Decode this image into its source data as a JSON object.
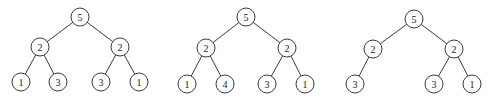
{
  "diagram": {
    "type": "binary-trees",
    "node_radius": 9,
    "colors": {
      "stroke": "#3a3a3a",
      "text": "#222222",
      "fill": "#ffffff"
    },
    "trees": [
      {
        "name": "tree-1",
        "nodes": [
          {
            "id": "r",
            "label": "5",
            "x": 80,
            "y": 17
          },
          {
            "id": "l",
            "label": "2",
            "x": 40,
            "y": 47
          },
          {
            "id": "rr",
            "label": "2",
            "x": 120,
            "y": 47
          },
          {
            "id": "ll",
            "label": "1",
            "x": 21,
            "y": 82
          },
          {
            "id": "lr",
            "label": "3",
            "x": 58,
            "y": 82
          },
          {
            "id": "rl",
            "label": "3",
            "x": 101,
            "y": 82
          },
          {
            "id": "rrr",
            "label": "1",
            "x": 139,
            "y": 82
          }
        ],
        "edges": [
          [
            "r",
            "l"
          ],
          [
            "r",
            "rr"
          ],
          [
            "l",
            "ll"
          ],
          [
            "l",
            "lr"
          ],
          [
            "rr",
            "rl"
          ],
          [
            "rr",
            "rrr"
          ]
        ]
      },
      {
        "name": "tree-2",
        "nodes": [
          {
            "id": "r",
            "label": "5",
            "x": 246,
            "y": 17
          },
          {
            "id": "l",
            "label": "2",
            "x": 206,
            "y": 48
          },
          {
            "id": "rr",
            "label": "2",
            "x": 287,
            "y": 48
          },
          {
            "id": "ll",
            "label": "1",
            "x": 187,
            "y": 84
          },
          {
            "id": "lr",
            "label": "4",
            "x": 225,
            "y": 84
          },
          {
            "id": "rl",
            "label": "3",
            "x": 267,
            "y": 84
          },
          {
            "id": "rrr",
            "label": "1",
            "x": 305,
            "y": 84
          }
        ],
        "edges": [
          [
            "r",
            "l"
          ],
          [
            "r",
            "rr"
          ],
          [
            "l",
            "ll"
          ],
          [
            "l",
            "lr"
          ],
          [
            "rr",
            "rl"
          ],
          [
            "rr",
            "rrr"
          ]
        ]
      },
      {
        "name": "tree-3",
        "nodes": [
          {
            "id": "r",
            "label": "5",
            "x": 414,
            "y": 19
          },
          {
            "id": "l",
            "label": "2",
            "x": 373,
            "y": 49
          },
          {
            "id": "rr",
            "label": "2",
            "x": 454,
            "y": 49
          },
          {
            "id": "ll",
            "label": "3",
            "x": 355,
            "y": 84
          },
          {
            "id": "rl",
            "label": "3",
            "x": 434,
            "y": 84
          },
          {
            "id": "rrr",
            "label": "1",
            "x": 472,
            "y": 84
          }
        ],
        "edges": [
          [
            "r",
            "l"
          ],
          [
            "r",
            "rr"
          ],
          [
            "l",
            "ll"
          ],
          [
            "rr",
            "rl"
          ],
          [
            "rr",
            "rrr"
          ]
        ]
      }
    ]
  }
}
